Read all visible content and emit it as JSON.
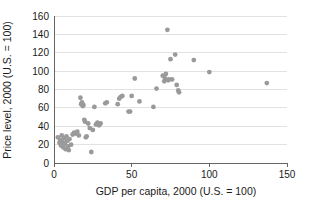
{
  "chart_data": {
    "type": "scatter",
    "title": "",
    "xlabel": "GDP per capita, 2000 (U.S. = 100)",
    "ylabel": "Price level, 2000 (U.S. = 100)",
    "xlim": [
      0,
      150
    ],
    "ylim": [
      0,
      160
    ],
    "xticks": [
      0,
      50,
      100,
      150
    ],
    "yticks": [
      0,
      20,
      40,
      60,
      80,
      100,
      120,
      140,
      160
    ],
    "xtick_labels": [
      "0",
      "50",
      "100",
      "150"
    ],
    "ytick_labels": [
      "0",
      "20",
      "40",
      "60",
      "80",
      "100",
      "120",
      "140",
      "160"
    ],
    "grid": "horizontal",
    "legend": "none",
    "marker_color": "#9a9a9a",
    "marker_size": 3,
    "points": [
      {
        "x": 2.5,
        "y": 28
      },
      {
        "x": 3.5,
        "y": 22
      },
      {
        "x": 4.0,
        "y": 25
      },
      {
        "x": 4.5,
        "y": 19
      },
      {
        "x": 5.0,
        "y": 30
      },
      {
        "x": 5.5,
        "y": 23
      },
      {
        "x": 6.0,
        "y": 17
      },
      {
        "x": 6.5,
        "y": 27
      },
      {
        "x": 7.0,
        "y": 21
      },
      {
        "x": 7.5,
        "y": 15
      },
      {
        "x": 8.0,
        "y": 29
      },
      {
        "x": 8.5,
        "y": 24
      },
      {
        "x": 9.0,
        "y": 18
      },
      {
        "x": 9.5,
        "y": 14
      },
      {
        "x": 10.0,
        "y": 26
      },
      {
        "x": 11.0,
        "y": 20
      },
      {
        "x": 12.0,
        "y": 31
      },
      {
        "x": 13.0,
        "y": 33
      },
      {
        "x": 14.0,
        "y": 32
      },
      {
        "x": 15.0,
        "y": 34
      },
      {
        "x": 16.0,
        "y": 30
      },
      {
        "x": 17.0,
        "y": 71
      },
      {
        "x": 17.5,
        "y": 64
      },
      {
        "x": 18.0,
        "y": 66
      },
      {
        "x": 18.5,
        "y": 62
      },
      {
        "x": 19.0,
        "y": 63
      },
      {
        "x": 19.5,
        "y": 47
      },
      {
        "x": 20.0,
        "y": 45
      },
      {
        "x": 20.5,
        "y": 28
      },
      {
        "x": 21.0,
        "y": 29
      },
      {
        "x": 22.0,
        "y": 43
      },
      {
        "x": 23.0,
        "y": 38
      },
      {
        "x": 24.0,
        "y": 12
      },
      {
        "x": 25.0,
        "y": 36
      },
      {
        "x": 26.0,
        "y": 61
      },
      {
        "x": 27.0,
        "y": 42
      },
      {
        "x": 28.0,
        "y": 44
      },
      {
        "x": 29.0,
        "y": 41
      },
      {
        "x": 30.0,
        "y": 43
      },
      {
        "x": 33.0,
        "y": 65
      },
      {
        "x": 34.0,
        "y": 66
      },
      {
        "x": 41.0,
        "y": 64
      },
      {
        "x": 42.0,
        "y": 70
      },
      {
        "x": 43.0,
        "y": 72
      },
      {
        "x": 44.0,
        "y": 73
      },
      {
        "x": 48.0,
        "y": 56
      },
      {
        "x": 49.0,
        "y": 56
      },
      {
        "x": 50.0,
        "y": 73
      },
      {
        "x": 52.0,
        "y": 92
      },
      {
        "x": 55.0,
        "y": 67
      },
      {
        "x": 64.0,
        "y": 61
      },
      {
        "x": 66.0,
        "y": 81
      },
      {
        "x": 70.0,
        "y": 95
      },
      {
        "x": 71.0,
        "y": 89
      },
      {
        "x": 71.5,
        "y": 92
      },
      {
        "x": 72.0,
        "y": 97
      },
      {
        "x": 73.0,
        "y": 145
      },
      {
        "x": 73.5,
        "y": 90
      },
      {
        "x": 74.0,
        "y": 91
      },
      {
        "x": 75.0,
        "y": 113
      },
      {
        "x": 76.0,
        "y": 91
      },
      {
        "x": 78.0,
        "y": 118
      },
      {
        "x": 79.0,
        "y": 85
      },
      {
        "x": 80.0,
        "y": 79
      },
      {
        "x": 80.5,
        "y": 77
      },
      {
        "x": 90.0,
        "y": 112
      },
      {
        "x": 100.0,
        "y": 99
      },
      {
        "x": 137.0,
        "y": 87
      }
    ]
  }
}
